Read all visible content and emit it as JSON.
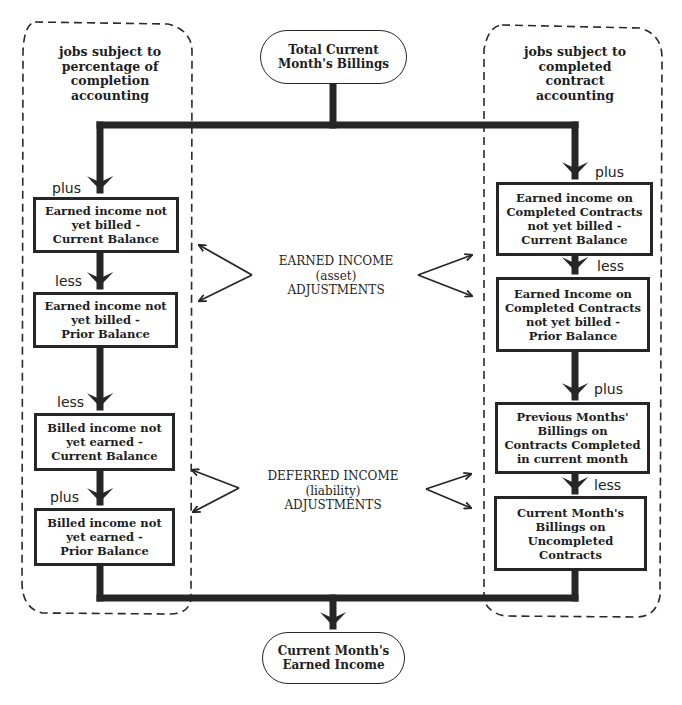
{
  "diagram": {
    "type": "flowchart",
    "start_node": {
      "label_line1": "Total Current",
      "label_line2": "Month's Billings"
    },
    "end_node": {
      "label_line1": "Current Month's",
      "label_line2": "Earned Income"
    },
    "left_region": {
      "label_lines": [
        "jobs subject to",
        "percentage of",
        "completion",
        "accounting"
      ],
      "steps": [
        {
          "operator": "plus",
          "lines": [
            "Earned income not",
            "yet billed -",
            "Current Balance"
          ]
        },
        {
          "operator": "less",
          "lines": [
            "Earned income not",
            "yet billed -",
            "Prior Balance"
          ]
        },
        {
          "operator": "less",
          "lines": [
            "Billed income not",
            "yet earned -",
            "Current Balance"
          ]
        },
        {
          "operator": "plus",
          "lines": [
            "Billed income not",
            "yet earned -",
            "Prior Balance"
          ]
        }
      ]
    },
    "right_region": {
      "label_lines": [
        "jobs subject to",
        "completed",
        "contract",
        "accounting"
      ],
      "steps": [
        {
          "operator": "plus",
          "lines": [
            "Earned income on",
            "Completed Contracts",
            "not yet billed -",
            "Current Balance"
          ]
        },
        {
          "operator": "less",
          "lines": [
            "Earned Income on",
            "Completed Contracts",
            "not yet billed -",
            "Prior Balance"
          ]
        },
        {
          "operator": "plus",
          "lines": [
            "Previous Months'",
            "Billings on",
            "Contracts Completed",
            "in current month"
          ]
        },
        {
          "operator": "less",
          "lines": [
            "Current Month's",
            "Billings on",
            "Uncompleted",
            "Contracts"
          ]
        }
      ]
    },
    "center_labels": [
      {
        "lines": [
          "EARNED INCOME",
          "(asset)",
          "ADJUSTMENTS"
        ]
      },
      {
        "lines": [
          "DEFERRED INCOME",
          "(liability)",
          "ADJUSTMENTS"
        ]
      }
    ],
    "colors": {
      "line": "#262626",
      "background": "#ffffff",
      "text": "#1e1e1e"
    }
  }
}
